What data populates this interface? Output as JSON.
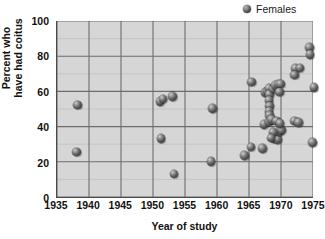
{
  "chart_data": {
    "type": "scatter",
    "title": "",
    "xlabel": "Year of study",
    "ylabel": "Percent who\nhave had coitus",
    "xlim": [
      1935,
      1975
    ],
    "ylim": [
      0,
      100
    ],
    "xticks": [
      1935,
      1940,
      1945,
      1950,
      1955,
      1960,
      1965,
      1970,
      1975
    ],
    "yticks": [
      0,
      20,
      40,
      60,
      80,
      100
    ],
    "grid": true,
    "grid_x_step": 5,
    "grid_y_step": 10,
    "legend_position": "top-right",
    "marker_color": "#4a4a4a",
    "plot_background": "#d6d6d6",
    "series": [
      {
        "name": "Females",
        "points": [
          [
            1938.2,
            52.5
          ],
          [
            1938.0,
            26.0
          ],
          [
            1951.0,
            54.5
          ],
          [
            1951.5,
            56.0
          ],
          [
            1953.0,
            57.5
          ],
          [
            1951.2,
            33.5
          ],
          [
            1953.2,
            13.5
          ],
          [
            1959.2,
            50.5
          ],
          [
            1959.0,
            20.5
          ],
          [
            1964.2,
            24.0
          ],
          [
            1965.2,
            28.8
          ],
          [
            1965.3,
            65.5
          ],
          [
            1967.0,
            27.8
          ],
          [
            1967.2,
            41.5
          ],
          [
            1967.4,
            59.5
          ],
          [
            1967.8,
            60.5
          ],
          [
            1968.0,
            62.0
          ],
          [
            1968.1,
            58.5
          ],
          [
            1968.0,
            55.0
          ],
          [
            1968.1,
            52.0
          ],
          [
            1968.0,
            49.0
          ],
          [
            1968.1,
            46.5
          ],
          [
            1968.2,
            44.0
          ],
          [
            1968.0,
            43.0
          ],
          [
            1968.4,
            44.5
          ],
          [
            1968.6,
            61.5
          ],
          [
            1969.0,
            63.5
          ],
          [
            1969.4,
            64.0
          ],
          [
            1969.8,
            64.5
          ],
          [
            1969.6,
            60.0
          ],
          [
            1968.8,
            33.5
          ],
          [
            1969.3,
            33.0
          ],
          [
            1969.6,
            37.5
          ],
          [
            1969.9,
            38.5
          ],
          [
            1968.6,
            37.0
          ],
          [
            1968.3,
            34.0
          ],
          [
            1969.2,
            43.5
          ],
          [
            1969.7,
            42.0
          ],
          [
            1972.0,
            43.5
          ],
          [
            1972.6,
            42.5
          ],
          [
            1972.1,
            73.0
          ],
          [
            1972.0,
            69.5
          ],
          [
            1972.8,
            73.5
          ],
          [
            1974.3,
            85.0
          ],
          [
            1974.4,
            81.0
          ],
          [
            1975.0,
            62.5
          ],
          [
            1974.8,
            31.5
          ]
        ]
      }
    ]
  },
  "legend": {
    "entries": [
      {
        "label": "Females",
        "marker": "sphere-marker"
      }
    ]
  }
}
